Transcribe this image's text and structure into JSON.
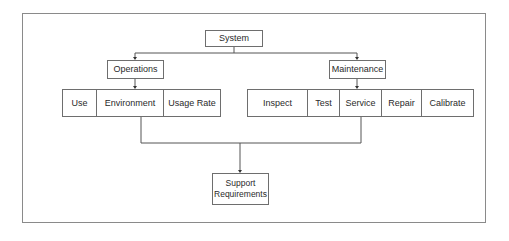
{
  "diagram": {
    "root": {
      "label": "System"
    },
    "branches": [
      {
        "label": "Operations",
        "children": [
          {
            "label": "Use"
          },
          {
            "label": "Environment"
          },
          {
            "label": "Usage Rate"
          }
        ]
      },
      {
        "label": "Maintenance",
        "children": [
          {
            "label": "Inspect"
          },
          {
            "label": "Test"
          },
          {
            "label": "Service"
          },
          {
            "label": "Repair"
          },
          {
            "label": "Calibrate"
          }
        ]
      }
    ],
    "output": {
      "label_line1": "Support",
      "label_line2": "Requirements"
    }
  }
}
